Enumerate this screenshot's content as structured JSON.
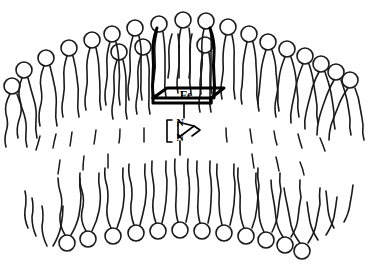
{
  "figure": {
    "background_color": "#ffffff",
    "line_color": "#1a1a1a",
    "width": 371,
    "height": 273
  },
  "membrane": {
    "type": "lipid-bilayer",
    "shape": "curved-arc",
    "outer_leaflet": {
      "name": "outer-leaflet",
      "head_count": 23,
      "head_shape": "circle",
      "head_radius": 8,
      "tails_per_lipid": 2,
      "tail_style": "wavy",
      "heads_face": "outward-up"
    },
    "inner_leaflet": {
      "name": "inner-leaflet",
      "head_count": 12,
      "head_shape": "circle",
      "head_radius": 8,
      "tails_per_lipid": 2,
      "tail_style": "wavy",
      "heads_face": "outward-down"
    }
  },
  "heme": {
    "name": "heme-porphyrin-complex",
    "metal_label": "Fe",
    "metal_label_color": "#000000",
    "plane_style": "perspective-parallelogram",
    "stroke_width": 3,
    "side_walls": 2
  },
  "ligand": {
    "name": "imidazole-ligand",
    "atom_labels": [
      "N",
      "N"
    ],
    "ring_size": 5,
    "bond_to_metal": "axial"
  },
  "annotations": {
    "fe_label": "Fe",
    "n_top_label": "N",
    "n_bottom_label": "N"
  }
}
